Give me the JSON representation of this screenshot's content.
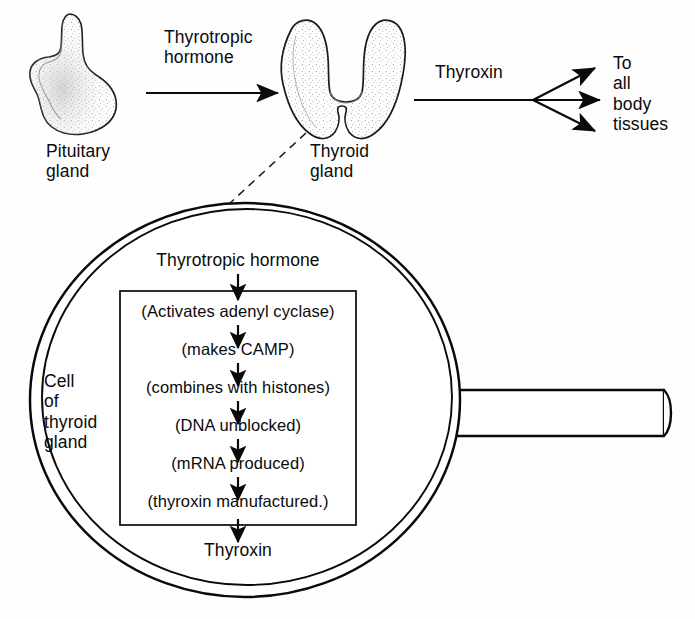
{
  "diagram": {
    "type": "biological-flow-diagram",
    "background_color": "#fefefe",
    "ink_color": "#0a0a0a"
  },
  "top_row": {
    "pituitary_label": "Pituitary\ngland",
    "thyroid_label": "Thyroid\ngland",
    "arrow1_label": "Thyrotropic\nhormone",
    "arrow2_label": "Thyroxin",
    "destination_label": "To\nall\nbody\ntissues"
  },
  "magnifier": {
    "cell_label": "Cell\nof\nthyroid\ngland",
    "input_label": "Thyrotropic hormone",
    "output_label": "Thyroxin",
    "steps": [
      "(Activates adenyl cyclase)",
      "(makes CAMP)",
      "(combines with histones)",
      "(DNA unblocked)",
      "(mRNA produced)",
      "(thyroxin manufactured.)"
    ]
  },
  "icons": {
    "pituitary": "pituitary-gland-icon",
    "thyroid": "thyroid-gland-icon",
    "magnifier": "magnifying-glass-icon",
    "arrow": "arrow-right-icon",
    "arrow_down": "arrow-down-icon",
    "dashed_leader": "dashed-leader-line"
  }
}
